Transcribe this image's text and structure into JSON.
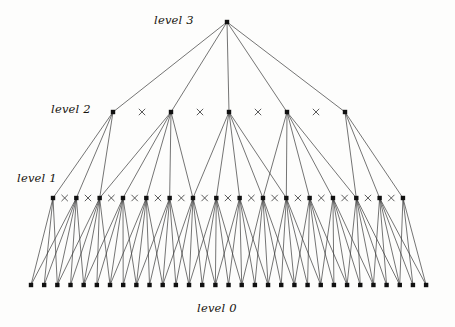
{
  "figure": {
    "type": "hierarchical-tree-diagram",
    "title": "",
    "background_color": "#fdfdfc",
    "node_color": "#111111",
    "edge_color": "#3a3a3a",
    "cross_mark_color": "#4a4a4a"
  },
  "labels": {
    "level3": "level 3",
    "level2": "level 2",
    "level1": "level 1",
    "level0": "level 0"
  },
  "chart_data": {
    "type": "diagram",
    "levels": [
      {
        "name": "level 3",
        "index": 3,
        "node_count": 1,
        "y": 22,
        "x_start": 227,
        "x_spacing": 0,
        "cross_marks": 0
      },
      {
        "name": "level 2",
        "index": 2,
        "node_count": 5,
        "y": 112,
        "x_start": 113,
        "x_spacing": 58,
        "cross_marks": 4
      },
      {
        "name": "level 1",
        "index": 1,
        "node_count": 16,
        "y": 198,
        "x_start": 53,
        "x_spacing": 23.33,
        "cross_marks": 15
      },
      {
        "name": "level 0",
        "index": 0,
        "node_count": 31,
        "y": 285,
        "x_start": 31,
        "x_spacing": 13.17,
        "cross_marks": 0
      }
    ],
    "fanout": 5,
    "node_radius": 2.2,
    "cross_size": 3.2,
    "edge_width": 0.7,
    "xlabel": "",
    "ylabel": "",
    "legend": []
  }
}
